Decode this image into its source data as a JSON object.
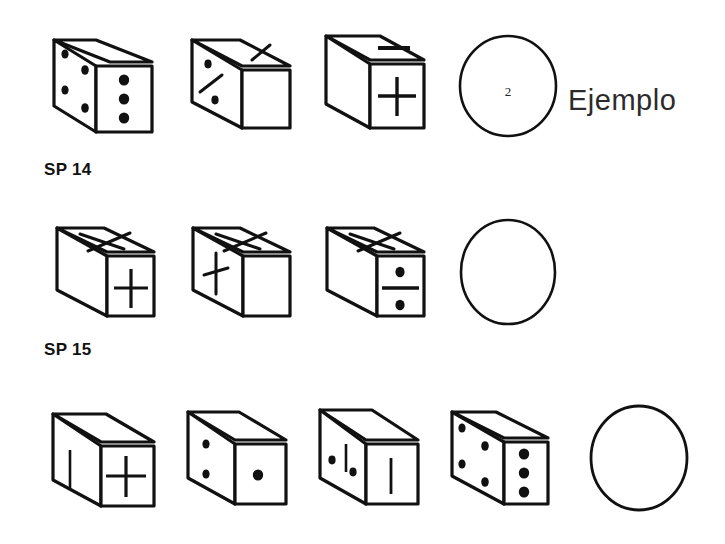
{
  "page": {
    "background_color": "#ffffff",
    "ink_color": "#111111"
  },
  "example": {
    "label": "Ejemplo",
    "answer_value": "2"
  },
  "rows": [
    {
      "id": "row-example",
      "label": "SP 14",
      "label_visible": true,
      "answer": {
        "value": "2",
        "filled": true
      },
      "cubes": [
        {
          "index": 1,
          "left_face": "four-dots",
          "front_face": "three-dots",
          "top_face": "blank",
          "description": "Cube with four dots on left face and three dots on front face"
        },
        {
          "index": 2,
          "left_face": "dot-diagonal-dot",
          "front_face": "blank",
          "top_face": "diagonal-line",
          "description": "Cube with diagonal line on top, dot over diagonal over dot on left face"
        },
        {
          "index": 3,
          "left_face": "blank",
          "front_face": "plus",
          "top_face": "horizontal-dash",
          "description": "Cube with horizontal dash on top and plus sign on front face"
        }
      ]
    },
    {
      "id": "row-sp15",
      "label": "SP 15",
      "label_visible": true,
      "answer": {
        "value": "",
        "filled": false
      },
      "cubes": [
        {
          "index": 1,
          "left_face": "blank",
          "front_face": "plus",
          "top_face": "cross-x",
          "description": "Cube with X on top face and plus sign on front face"
        },
        {
          "index": 2,
          "left_face": "plus",
          "front_face": "blank",
          "top_face": "cross-x",
          "description": "Cube with X on top face and plus sign on left face"
        },
        {
          "index": 3,
          "left_face": "blank",
          "front_face": "division-sign",
          "top_face": "cross-x",
          "description": "Cube with X on top face and division sign on front face"
        }
      ]
    },
    {
      "id": "row-sp16",
      "label": "",
      "label_visible": false,
      "answer": {
        "value": "",
        "filled": false
      },
      "cubes": [
        {
          "index": 1,
          "left_face": "vertical-line",
          "front_face": "plus",
          "top_face": "blank",
          "description": "Cube with vertical line on left face and plus sign on front face"
        },
        {
          "index": 2,
          "left_face": "two-dots",
          "front_face": "one-dot",
          "top_face": "blank",
          "description": "Cube with two dots on left face and one dot on front face"
        },
        {
          "index": 3,
          "left_face": "dot-line-dot",
          "front_face": "vertical-line",
          "top_face": "blank",
          "description": "Cube with dot, vertical line and dot on left face, vertical line on front face"
        },
        {
          "index": 4,
          "left_face": "four-dots",
          "front_face": "three-dots",
          "top_face": "blank",
          "description": "Cube with four dots on left face and three dots on front face"
        }
      ]
    }
  ]
}
